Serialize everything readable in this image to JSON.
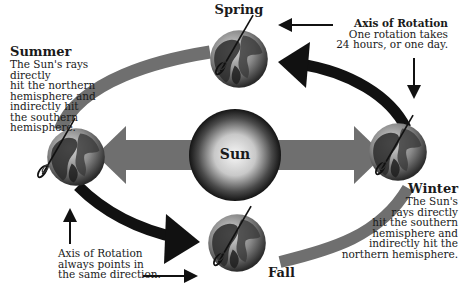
{
  "diagram": {
    "center": {
      "label": "Sun"
    },
    "seasons": [
      {
        "id": "spring",
        "title": "Spring"
      },
      {
        "id": "summer",
        "title": "Summer",
        "description": [
          "The Sun's rays directly",
          "hit the northern",
          "hemisphere and",
          "indirectly hit",
          "the southern",
          "hemisphere."
        ]
      },
      {
        "id": "winter",
        "title": "Winter",
        "description": [
          "The Sun's",
          "rays directly",
          "hit the southern",
          "hemisphere and",
          "indirectly hit the",
          "northern hemisphere."
        ]
      },
      {
        "id": "fall",
        "title": "Fall"
      }
    ],
    "annotations": {
      "axis_top": {
        "title": "Axis of Rotation",
        "lines": [
          "One rotation takes",
          "24 hours, or one day."
        ]
      },
      "axis_bottom": {
        "lines": [
          "Axis of Rotation",
          "always points in",
          "the same direction."
        ]
      }
    },
    "colors": {
      "orbit_gray": "#6f6f6f",
      "orbit_black": "#111111",
      "sun_edge": "#1a1a1a",
      "sun_center": "#f4f4f4"
    }
  }
}
